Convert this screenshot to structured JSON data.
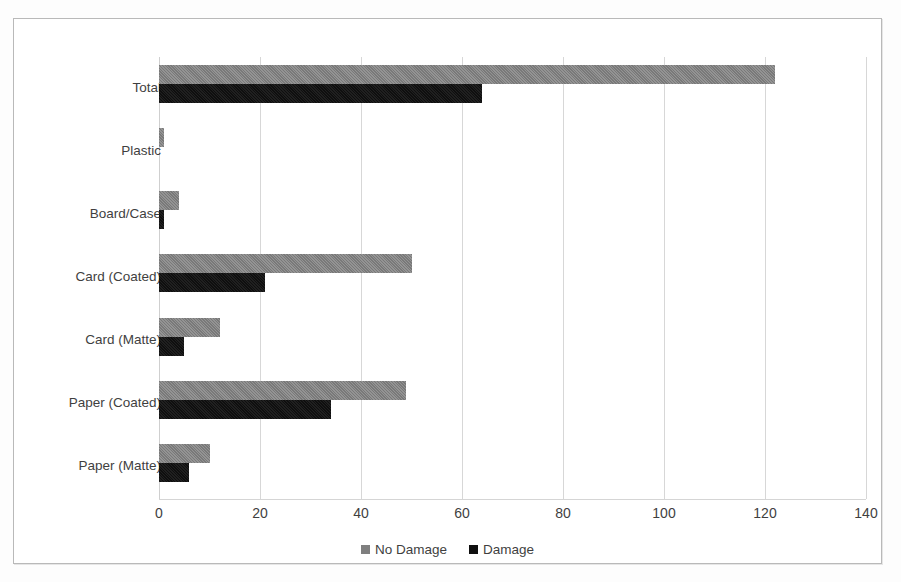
{
  "chart_data": {
    "type": "bar",
    "orientation": "horizontal",
    "title": "",
    "xlabel": "",
    "ylabel": "",
    "xlim": [
      0,
      140
    ],
    "xticks": [
      0,
      20,
      40,
      60,
      80,
      100,
      120,
      140
    ],
    "grid": true,
    "legend_position": "bottom",
    "categories": [
      "Total",
      "Plastic",
      "Board/Case",
      "Card (Coated)",
      "Card (Matte)",
      "Paper (Coated)",
      "Paper (Matte)"
    ],
    "series": [
      {
        "name": "No Damage",
        "color": "#7f7f7f",
        "values": [
          122,
          1,
          4,
          50,
          12,
          49,
          10
        ]
      },
      {
        "name": "Damage",
        "color": "#0f0f0f",
        "values": [
          64,
          0,
          1,
          21,
          5,
          34,
          6
        ]
      }
    ]
  },
  "legend": {
    "items": [
      {
        "label": "No Damage",
        "swatch": "nodamage"
      },
      {
        "label": "Damage",
        "swatch": "damage"
      }
    ]
  }
}
